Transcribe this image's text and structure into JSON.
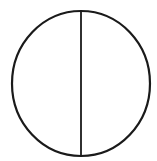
{
  "diagram": {
    "shape": "circle-divided-by-vertical-diameter",
    "stroke_color": "#1a1a1a",
    "background": "#ffffff",
    "circle": {
      "cx": 81,
      "cy": 83.5,
      "rx": 69,
      "ry": 72.5,
      "stroke_width": 2.2
    },
    "divider": {
      "x": 81,
      "y1": 11,
      "y2": 156,
      "stroke_width": 1.8
    }
  }
}
